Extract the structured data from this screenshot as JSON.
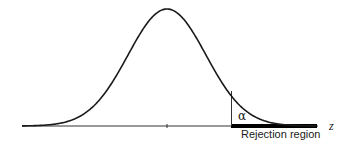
{
  "chart_data": {
    "type": "line",
    "title": "",
    "xlabel": "z",
    "ylabel": "",
    "grid": false,
    "legend": null,
    "series": [
      {
        "name": "Normal density",
        "distribution": "normal",
        "mean": 0,
        "sd": 1
      }
    ],
    "center_tick": 0,
    "critical_value_note": "vertical line at the start of the rejection region (approx z = 1.645)",
    "annotations": [
      {
        "text": "α",
        "meaning": "shaded tail area under curve right of critical value"
      },
      {
        "text": "Rejection region",
        "meaning": "thick bar on z-axis from critical value to right end"
      }
    ]
  },
  "labels": {
    "alpha": "α",
    "rejection_region": "Rejection region",
    "axis": "z"
  },
  "colors": {
    "curve": "#1a1a1a",
    "axis": "#333333",
    "rejection_bar": "#000000",
    "background": "#ffffff"
  }
}
